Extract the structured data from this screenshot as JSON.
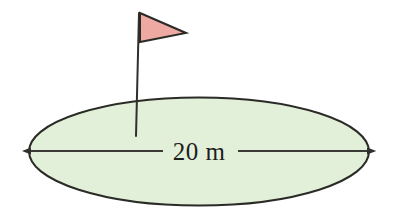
{
  "figure": {
    "background_color": "#ffffff"
  },
  "green": {
    "name": "green-ellipse",
    "shape": "ellipse",
    "fill_color": "#e3f0d9",
    "stroke_color": "#2a2a26",
    "stroke_width": 2,
    "center_x": 199,
    "center_y": 151.5,
    "radius_x": 170,
    "radius_y": 54
  },
  "flag": {
    "name": "golf-flag",
    "pole": {
      "name": "flag-pole",
      "stroke_color": "#2f2f2c",
      "stroke_width": 2,
      "top_x": 139,
      "top_y": 13,
      "bottom_x": 136,
      "bottom_y": 136
    },
    "banner": {
      "name": "flag-banner",
      "fill_color": "#eda9a2",
      "stroke_color": "#2a2a26",
      "stroke_width": 2,
      "points": "140,13 186,33 140,42"
    }
  },
  "dimension": {
    "name": "width-dimension",
    "label": "20 m",
    "value": 20,
    "unit": "m",
    "line_y": 151,
    "start_x": 31,
    "end_x": 367,
    "stroke_color": "#3a3a36",
    "stroke_width": 2,
    "label_x": 199,
    "label_y": 160,
    "label_color": "#1d1d1d",
    "arrowheads": "both",
    "gap_left_x": 163,
    "gap_right_x": 238
  }
}
